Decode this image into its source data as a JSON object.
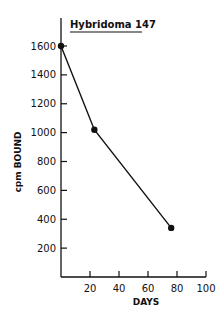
{
  "chart_data": {
    "type": "line",
    "title": "Hybridoma 147",
    "xlabel": "DAYS",
    "ylabel": "cpm BOUND",
    "x_ticks": [
      "20",
      "40",
      "60",
      "80",
      "100"
    ],
    "y_ticks": [
      "200",
      "400",
      "600",
      "800",
      "1000",
      "1200",
      "1400",
      "1600"
    ],
    "xlim": [
      0,
      100
    ],
    "ylim": [
      0,
      1800
    ],
    "grid": false,
    "series": [
      {
        "name": "Hybridoma 147",
        "x": [
          0,
          23,
          76
        ],
        "y": [
          1600,
          1020,
          340
        ]
      }
    ]
  }
}
